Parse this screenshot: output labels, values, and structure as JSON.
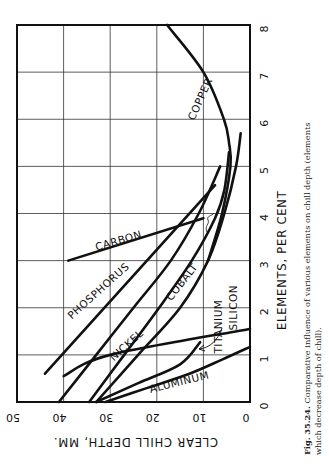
{
  "caption": {
    "fig_label": "Fig. 35.24.",
    "line1": "Comparative influence of various elements on chill depth (elements",
    "line2": "which decrease depth of chill)."
  },
  "chart_data": {
    "type": "line",
    "title": "",
    "xlabel": "ELEMENTS, PER CENT",
    "ylabel": "CLEAR CHILL DEPTH, MM.",
    "xlim": [
      0,
      8
    ],
    "ylim": [
      0,
      50
    ],
    "x_ticks": [
      "0",
      "1",
      "2",
      "3",
      "4",
      "5",
      "6",
      "7",
      "8"
    ],
    "y_ticks": [
      "0",
      "10",
      "20",
      "30",
      "40",
      "50"
    ],
    "grid": true,
    "orientation": "rotated 90deg counterclockwise (percent axis vertical on right, depth axis horizontal along bottom, reversed)",
    "series": [
      {
        "name": "PHOSPHORUS",
        "points": [
          [
            0.6,
            44
          ],
          [
            4.6,
            7.5
          ]
        ]
      },
      {
        "name": "CARBON",
        "points": [
          [
            3.0,
            39
          ],
          [
            3.9,
            10
          ]
        ]
      },
      {
        "name": "NICKEL",
        "points": [
          [
            0,
            41
          ],
          [
            1,
            33
          ],
          [
            2,
            25
          ],
          [
            3,
            17
          ],
          [
            4,
            11
          ],
          [
            5,
            6.4
          ]
        ]
      },
      {
        "name": "COBALT",
        "points": [
          [
            0,
            34.5
          ],
          [
            1,
            27
          ],
          [
            2,
            19.5
          ],
          [
            3,
            12.5
          ],
          [
            3.9,
            7.5
          ],
          [
            4.5,
            5.5
          ],
          [
            5.3,
            4.5
          ]
        ]
      },
      {
        "name": "SILICON",
        "points": [
          [
            0,
            33
          ],
          [
            1,
            24
          ],
          [
            2,
            15
          ],
          [
            3,
            9
          ],
          [
            4,
            5.5
          ],
          [
            5,
            3
          ],
          [
            5.7,
            2
          ]
        ]
      },
      {
        "name": "TITANIUM",
        "points": [
          [
            0,
            33
          ],
          [
            0.4,
            24
          ],
          [
            0.8,
            15
          ],
          [
            1.27,
            10.7
          ]
        ]
      },
      {
        "name": "ALUMINUM",
        "points": [
          [
            0,
            31
          ],
          [
            0.3,
            22
          ],
          [
            0.6,
            13
          ],
          [
            0.9,
            6
          ],
          [
            1.17,
            0
          ]
        ]
      },
      {
        "name": "COPPER",
        "points": [
          [
            0.55,
            40
          ],
          [
            1,
            30
          ],
          [
            1.55,
            0
          ]
        ],
        "note": "low-percent branch reaching right border"
      },
      {
        "name": "COPPER",
        "points": [
          [
            3,
            9
          ],
          [
            4,
            6
          ],
          [
            5,
            4.2
          ],
          [
            5.5,
            4.5
          ],
          [
            6,
            5.6
          ],
          [
            7,
            10
          ],
          [
            8,
            17.8
          ]
        ]
      }
    ],
    "labels": [
      {
        "text": "PHOSPHORUS",
        "pct": 2.3,
        "depth": 32,
        "angle": -42
      },
      {
        "text": "CARBON",
        "pct": 3.35,
        "depth": 28,
        "angle": -16
      },
      {
        "text": "NICKEL",
        "pct": 1.15,
        "depth": 26,
        "angle": -42
      },
      {
        "text": "COBALT",
        "pct": 2.5,
        "depth": 14,
        "angle": -52
      },
      {
        "text": "TITANIUM",
        "pct": 1.6,
        "depth": 6,
        "angle": -90
      },
      {
        "text": "SILICON",
        "pct": 2.0,
        "depth": 2.8,
        "angle": -90
      },
      {
        "text": "ALUMINUM",
        "pct": 0.35,
        "depth": 15,
        "angle": -14
      },
      {
        "text": "COPPER",
        "pct": 6.4,
        "depth": 10,
        "angle": -66
      }
    ]
  }
}
